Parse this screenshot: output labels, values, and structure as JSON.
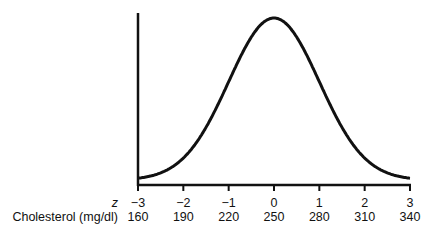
{
  "chart_data": {
    "type": "line",
    "title": "",
    "xlabel_rows": [
      {
        "name": "z",
        "ticks": [
          "−3",
          "−2",
          "−1",
          "0",
          "1",
          "2",
          "3"
        ]
      },
      {
        "name": "Cholesterol (mg/dl)",
        "ticks": [
          "160",
          "190",
          "220",
          "250",
          "280",
          "310",
          "340"
        ]
      }
    ],
    "x": [
      -3,
      -2,
      -1,
      0,
      1,
      2,
      3
    ],
    "cholesterol": [
      160,
      190,
      220,
      250,
      280,
      310,
      340
    ],
    "mean": 250,
    "sd": 30,
    "ylabel": "",
    "xlim": [
      -3,
      3
    ],
    "grid": false,
    "legend": null
  },
  "labels": {
    "z_title": "z",
    "chol_title": "Cholesterol (mg/dl)"
  }
}
